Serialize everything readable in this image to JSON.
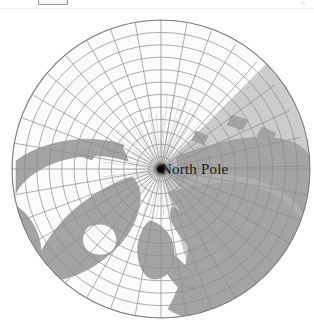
{
  "window": {
    "title": "North Pole Polar Projection Map"
  },
  "toolbar": {
    "button_label": "",
    "caret_label": ""
  },
  "map": {
    "title": "North Pole",
    "pole_label": "North Pole",
    "projection": "azimuthal polar",
    "center_marker": "pole-dot",
    "colors": {
      "ocean": "#fbfbfb",
      "land": "#ababab",
      "land_dark": "#a2a2a2",
      "graticule": "#8d8d8d",
      "outline": "#7d7d7d",
      "pole_dot": "#000000",
      "label_text": "#1c1c1c",
      "background": "#ffffff"
    },
    "graticule": {
      "latitude_circles": 12,
      "meridians": 36,
      "pole_rays": 72
    },
    "geometry": {
      "center_x": 161,
      "center_y": 158,
      "radius": 149
    }
  }
}
